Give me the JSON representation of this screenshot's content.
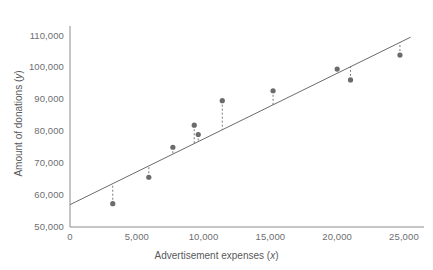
{
  "chart_data": {
    "type": "scatter",
    "title": "",
    "xlabel": "Advertisement expenses (x)",
    "ylabel": "Amount of donations (y)",
    "xlim": [
      0,
      26500
    ],
    "ylim": [
      50000,
      113000
    ],
    "xticks": [
      0,
      5000,
      10000,
      15000,
      20000,
      25000
    ],
    "xtick_labels": [
      "0",
      "5,000",
      "10,000",
      "15,000",
      "20,000",
      "25,000"
    ],
    "yticks": [
      50000,
      60000,
      70000,
      80000,
      90000,
      100000,
      110000
    ],
    "ytick_labels": [
      "50,000",
      "60,000",
      "70,000",
      "80,000",
      "90,000",
      "100,000",
      "110,000"
    ],
    "grid": false,
    "legend": "none",
    "marker_color": "#6b6b6b",
    "line_color": "#6b6b6b",
    "residual_style": "dashed",
    "points": [
      {
        "x": 3200,
        "y": 57300
      },
      {
        "x": 5900,
        "y": 65600
      },
      {
        "x": 7700,
        "y": 75000
      },
      {
        "x": 9300,
        "y": 81900
      },
      {
        "x": 9600,
        "y": 79000
      },
      {
        "x": 11400,
        "y": 89600
      },
      {
        "x": 15200,
        "y": 92700
      },
      {
        "x": 20000,
        "y": 99500
      },
      {
        "x": 21000,
        "y": 96100
      },
      {
        "x": 24700,
        "y": 103900
      }
    ],
    "regression_line": {
      "intercept": 57000,
      "slope": 2.06,
      "x_start": 0,
      "x_end": 25500,
      "y_start": 57000,
      "y_end": 109500
    }
  }
}
